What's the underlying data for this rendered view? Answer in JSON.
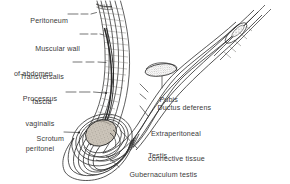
{
  "figure": {
    "kind": "anatomical-line-drawing",
    "style": {
      "background": "#ffffff",
      "ink": "#2b2b2b",
      "leader_line": "#3a3a3a",
      "stipple_fill": "#b9b2a8",
      "hatch": "#6e6a66"
    }
  },
  "labels": [
    {
      "id": "peritoneum",
      "text": "Peritoneum",
      "align": "right"
    },
    {
      "id": "muscular-wall",
      "text": "Muscular wall\nof abdomen",
      "align": "right"
    },
    {
      "id": "transversalis",
      "text": "Transversalis\nfascia",
      "align": "center"
    },
    {
      "id": "processus",
      "text": "Processus\nvaginalis\nperitonei",
      "align": "center"
    },
    {
      "id": "scrotum",
      "text": "Scrotum",
      "align": "right"
    },
    {
      "id": "pubis",
      "text": "Pubis",
      "align": "left"
    },
    {
      "id": "ductus-deferens",
      "text": "Ductus deferens",
      "align": "left"
    },
    {
      "id": "extraperitoneal",
      "text": "Extraperitoneal\nconnective tissue",
      "align": "left"
    },
    {
      "id": "testis",
      "text": "Testis",
      "align": "left"
    },
    {
      "id": "gubernaculum",
      "text": "Gubernaculum testis",
      "align": "left"
    }
  ],
  "label_text": {
    "peritoneum": "Peritoneum",
    "muscular_wall_l1": "Muscular wall",
    "muscular_wall_l2": "of abdomen",
    "transversalis_l1": "Transversalis",
    "transversalis_l2": "fascia",
    "processus_l1": "Processus",
    "processus_l2": "vaginalis",
    "processus_l3": "peritonei",
    "scrotum": "Scrotum",
    "pubis": "Pubis",
    "ductus_deferens": "Ductus deferens",
    "extraperitoneal_l1": "Extraperitoneal",
    "extraperitoneal_l2": "connective tissue",
    "testis": "Testis",
    "gubernaculum": "Gubernaculum testis"
  }
}
